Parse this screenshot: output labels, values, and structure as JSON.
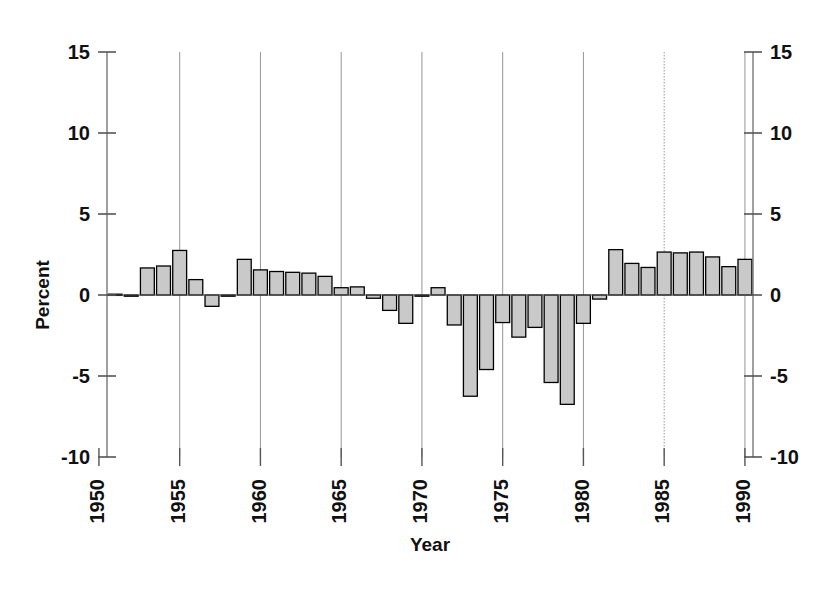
{
  "chart_data": {
    "type": "bar",
    "title": "",
    "subtitle": "",
    "xlabel": "Year",
    "ylabel": "Percent",
    "ylim": [
      -10,
      15
    ],
    "xlim": [
      1950.5,
      1990.5
    ],
    "yticks": [
      15,
      10,
      5,
      0,
      -5,
      -10
    ],
    "ytick_labels": [
      "15",
      "10",
      "5",
      "0",
      "-5",
      "-10"
    ],
    "yticks_right": [
      15,
      10,
      5,
      0,
      -5,
      -10
    ],
    "ytick_labels_right": [
      "15",
      "10",
      "5",
      "0",
      "-5",
      "-10"
    ],
    "xticks": [
      1950,
      1955,
      1960,
      1965,
      1970,
      1975,
      1980,
      1985,
      1990
    ],
    "xtick_labels": [
      "1950",
      "1955",
      "1960",
      "1965",
      "1970",
      "1975",
      "1980",
      "1985",
      "1990"
    ],
    "xtick_rotation": 90,
    "grid": "vertical-only",
    "gridline_years": [
      1955,
      1960,
      1965,
      1970,
      1975,
      1980,
      1985,
      1990
    ],
    "legend": "none",
    "bar_fill": "#c9c9c9",
    "bar_stroke": "#000000",
    "axis_color": "#555555",
    "categories": [
      1951,
      1952,
      1953,
      1954,
      1955,
      1956,
      1957,
      1958,
      1959,
      1960,
      1961,
      1962,
      1963,
      1964,
      1965,
      1966,
      1967,
      1968,
      1969,
      1970,
      1971,
      1972,
      1973,
      1974,
      1975,
      1976,
      1977,
      1978,
      1979,
      1980,
      1981,
      1982,
      1983,
      1984,
      1985,
      1986,
      1987,
      1988,
      1989,
      1990
    ],
    "values": [
      0.05,
      0.0,
      1.67,
      1.79,
      2.75,
      0.95,
      -0.7,
      0.0,
      2.2,
      1.55,
      1.45,
      1.4,
      1.35,
      1.15,
      0.45,
      0.5,
      -0.2,
      -0.95,
      -1.75,
      0.0,
      0.45,
      -1.85,
      -6.25,
      -4.6,
      -1.7,
      -2.6,
      -2.0,
      -5.4,
      -6.75,
      -1.75,
      -0.25,
      2.8,
      1.95,
      1.7,
      2.65,
      2.6,
      2.65,
      2.35,
      1.75,
      2.2
    ]
  },
  "axes": {
    "left_title": "Percent",
    "bottom_title": "Year"
  }
}
